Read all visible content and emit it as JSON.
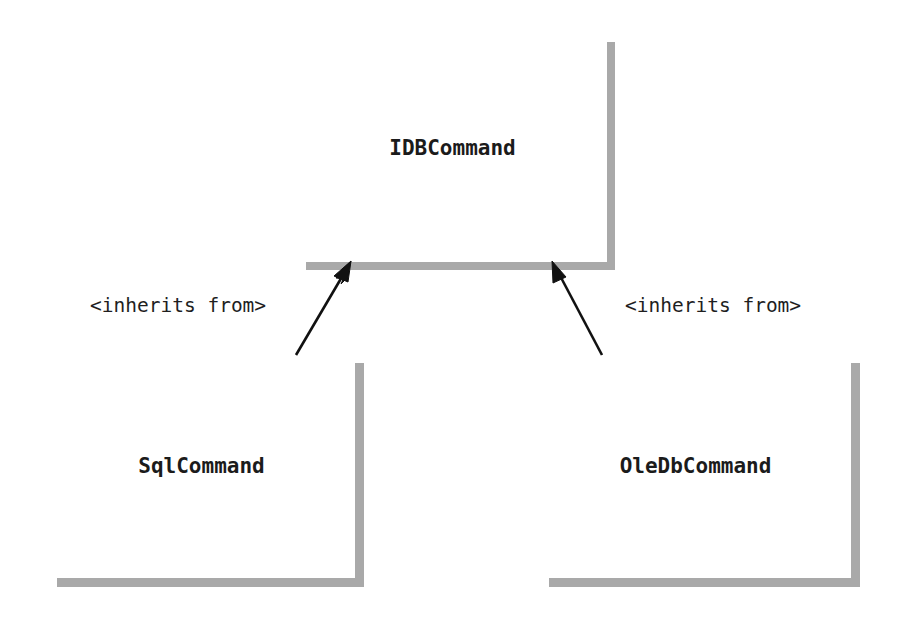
{
  "diagram": {
    "type": "uml-class-diagram",
    "background_color": "#ffffff",
    "box_fill_color": "#ffffff",
    "box_border_color": "#3a3a3a",
    "box_shadow_color": "#a9a9a9",
    "line_color": "#111111",
    "text_color": "#1b1b1b",
    "classes": [
      {
        "id": "idbcommand",
        "name": "IDBCommand",
        "role": "interface",
        "x": 298,
        "y": 34,
        "width": 309,
        "height": 228
      },
      {
        "id": "sqlcommand",
        "name": "SqlCommand",
        "role": "implementation",
        "x": 48,
        "y": 354,
        "width": 307,
        "height": 224
      },
      {
        "id": "oledbcommand",
        "name": "OleDbCommand",
        "role": "implementation",
        "x": 540,
        "y": 354,
        "width": 311,
        "height": 224
      }
    ],
    "relationships": [
      {
        "id": "sql-inherits-idb",
        "label": "<inherits from>",
        "from": "sqlcommand",
        "to": "idbcommand",
        "arrow_style": "solid-filled",
        "start_x": 296,
        "start_y": 355,
        "end_x": 350,
        "end_y": 263,
        "label_x": 90,
        "label_y": 296
      },
      {
        "id": "oledb-inherits-idb",
        "label": "<inherits from>",
        "from": "oledbcommand",
        "to": "idbcommand",
        "arrow_style": "solid-filled",
        "start_x": 602,
        "start_y": 355,
        "end_x": 553,
        "end_y": 263,
        "label_x": 625,
        "label_y": 296
      }
    ]
  }
}
